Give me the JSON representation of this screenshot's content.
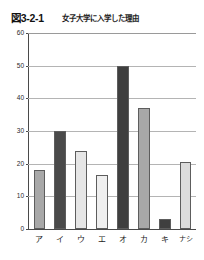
{
  "figure": {
    "number": "図3-2-1",
    "title": "女子大学に入学した理由"
  },
  "colors": {
    "axis": "#4a4a4a",
    "grid": "#b4b4b4",
    "bar_border": "#5d5d5d",
    "bar_medium_gray": "#a8a8a8",
    "bar_dark": "#4a4a4a",
    "bar_light": "#e2e2e2",
    "bar_pale": "#efefef",
    "background": "#ffffff"
  },
  "chart_data": {
    "type": "bar",
    "title": "女子大学に入学した理由",
    "xlabel": "",
    "ylabel": "",
    "ylim": [
      0,
      60
    ],
    "yticks": [
      0,
      10,
      20,
      30,
      40,
      50,
      60
    ],
    "ytick_labels": [
      "0",
      "10",
      "20",
      "30",
      "40",
      "50",
      "60"
    ],
    "grid": true,
    "legend": "none",
    "categories": [
      "ア",
      "イ",
      "ウ",
      "エ",
      "オ",
      "カ",
      "キ",
      "ナシ"
    ],
    "values": [
      18,
      30,
      24,
      16.5,
      50,
      37,
      3,
      20.5
    ],
    "bar_fills": [
      "#a8a8a8",
      "#4a4a4a",
      "#e6e6e6",
      "#efefef",
      "#3f3f3f",
      "#a8a8a8",
      "#3f3f3f",
      "#dcdcdc"
    ]
  }
}
